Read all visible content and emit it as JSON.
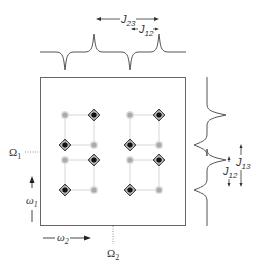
{
  "diagram": {
    "type": "2D NMR COSY-style spectrum schematic",
    "top_spectrum": {
      "labels": {
        "j23": {
          "main": "J",
          "sub": "23"
        },
        "j12": {
          "main": "J",
          "sub": "12"
        }
      }
    },
    "side_spectrum": {
      "labels": {
        "j13": {
          "main": "J",
          "sub": "13"
        },
        "j12": {
          "main": "J",
          "sub": "12"
        }
      }
    },
    "axes": {
      "omega1": {
        "main": "ω",
        "sub": "1"
      },
      "omega2": {
        "main": "ω",
        "sub": "2"
      },
      "Omega1": {
        "main": "Ω",
        "sub": "1"
      },
      "Omega2": {
        "main": "Ω",
        "sub": "2"
      }
    },
    "peaks": {
      "columns_x": [
        65,
        94,
        130,
        159
      ],
      "rows_y": [
        115,
        145,
        160,
        190
      ],
      "pattern": [
        [
          "light",
          "dark",
          "light",
          "dark"
        ],
        [
          "dark",
          "light",
          "dark",
          "light"
        ],
        [
          "light",
          "dark",
          "light",
          "dark"
        ],
        [
          "dark",
          "light",
          "dark",
          "light"
        ]
      ]
    },
    "colors": {
      "line": "#555555",
      "dark_peak": "#111111",
      "light_peak": "#aaaaaa",
      "grid_line": "#cccccc"
    }
  }
}
